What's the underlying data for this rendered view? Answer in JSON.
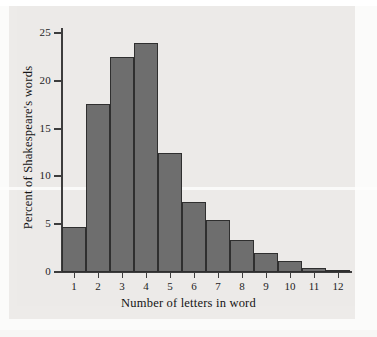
{
  "chart_data": {
    "type": "bar",
    "title": "",
    "xlabel": "Number of letters in word",
    "ylabel": "Percent of Shakespeare's words",
    "categories": [
      "1",
      "2",
      "3",
      "4",
      "5",
      "6",
      "7",
      "8",
      "9",
      "10",
      "11",
      "12"
    ],
    "values": [
      4.7,
      17.6,
      22.5,
      24.0,
      12.5,
      7.3,
      5.4,
      3.3,
      2.0,
      1.1,
      0.4,
      0.2
    ],
    "ylim": [
      0,
      26
    ],
    "xlim": [
      0.5,
      12.5
    ],
    "yticks": [
      "0",
      "5",
      "10",
      "15",
      "20",
      "25"
    ],
    "ytick_values": [
      0,
      5,
      10,
      15,
      20,
      25
    ],
    "grid": false,
    "legend": "none",
    "bar_color": "#6e6e6e",
    "bar_edge_color": "#2f2f2f",
    "panel_color": "#eceae8",
    "axis_color": "#3d3d3d"
  }
}
